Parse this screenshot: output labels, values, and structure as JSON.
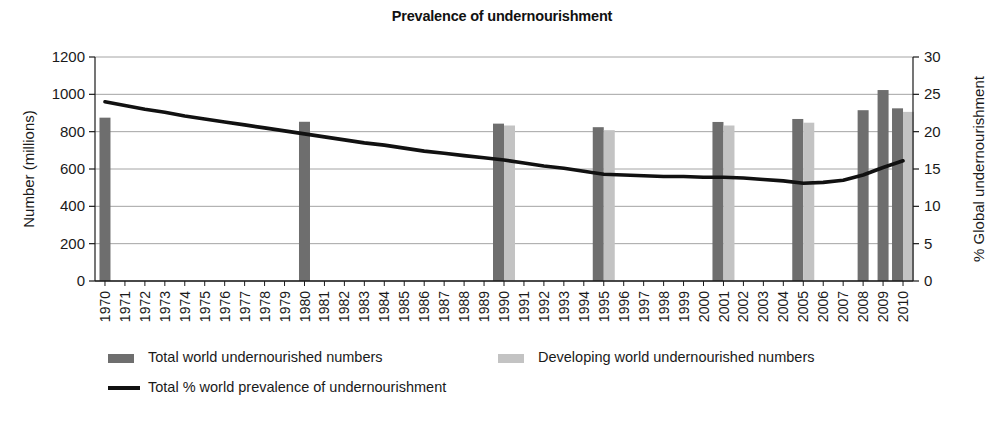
{
  "chart_data": {
    "type": "bar",
    "title": "Prevalence of undernourishment",
    "xlabel": "",
    "ylabel": "Number (millions)",
    "y2label": "% Global undernourishment",
    "ylim": [
      0,
      1200
    ],
    "y2lim": [
      0,
      30
    ],
    "yticks": [
      0,
      200,
      400,
      600,
      800,
      1000,
      1200
    ],
    "y2ticks": [
      0,
      5,
      10,
      15,
      20,
      25,
      30
    ],
    "grid": true,
    "legend_position": "bottom",
    "categories": [
      "1970",
      "1971",
      "1972",
      "1973",
      "1974",
      "1975",
      "1976",
      "1977",
      "1978",
      "1979",
      "1980",
      "1981",
      "1982",
      "1983",
      "1984",
      "1985",
      "1986",
      "1987",
      "1988",
      "1989",
      "1990",
      "1991",
      "1992",
      "1993",
      "1994",
      "1995",
      "1996",
      "1997",
      "1998",
      "1999",
      "2000",
      "2001",
      "2002",
      "2003",
      "2004",
      "2005",
      "2006",
      "2007",
      "2008",
      "2009",
      "2010"
    ],
    "series": [
      {
        "name": "Total world undernourished numbers",
        "type": "bar",
        "color": "#6e6e6e",
        "axis": "left",
        "values": [
          875,
          null,
          null,
          null,
          null,
          null,
          null,
          null,
          null,
          null,
          853,
          null,
          null,
          null,
          null,
          null,
          null,
          null,
          null,
          null,
          843,
          null,
          null,
          null,
          null,
          824,
          null,
          null,
          null,
          null,
          null,
          852,
          null,
          null,
          null,
          868,
          null,
          null,
          915,
          1023,
          925
        ]
      },
      {
        "name": "Developing world undernourished numbers",
        "type": "bar",
        "color": "#c3c3c3",
        "axis": "left",
        "values": [
          null,
          null,
          null,
          null,
          null,
          null,
          null,
          null,
          null,
          null,
          null,
          null,
          null,
          null,
          null,
          null,
          null,
          null,
          null,
          null,
          833,
          null,
          null,
          null,
          null,
          808,
          null,
          null,
          null,
          null,
          null,
          833,
          null,
          null,
          null,
          848,
          null,
          null,
          null,
          null,
          906
        ]
      },
      {
        "name": "Total % world prevalence of undernourishment",
        "type": "line",
        "color": "#111111",
        "axis": "right",
        "values": [
          24.0,
          23.5,
          23.0,
          22.6,
          22.1,
          21.7,
          21.3,
          20.9,
          20.5,
          20.1,
          19.7,
          19.3,
          18.9,
          18.5,
          18.2,
          17.8,
          17.4,
          17.1,
          16.8,
          16.5,
          16.2,
          15.8,
          15.4,
          15.1,
          14.7,
          14.3,
          14.2,
          14.1,
          14.0,
          14.0,
          13.9,
          13.9,
          13.8,
          13.6,
          13.4,
          13.1,
          13.2,
          13.5,
          14.2,
          15.2,
          16.1
        ]
      }
    ]
  },
  "legend": {
    "items": [
      {
        "label": "Total world undernourished numbers",
        "marker": "swatch",
        "color": "#6e6e6e"
      },
      {
        "label": "Developing world undernourished numbers",
        "marker": "swatch",
        "color": "#c3c3c3"
      },
      {
        "label": "Total % world prevalence of undernourishment",
        "marker": "line",
        "color": "#111111"
      }
    ]
  }
}
